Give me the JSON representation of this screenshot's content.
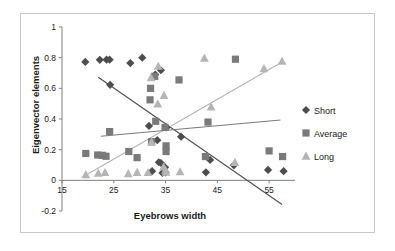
{
  "chart_data": {
    "type": "scatter",
    "title": "",
    "xlabel": "Eyebrows width",
    "ylabel": "Eigenvector elements",
    "xlim": [
      15,
      60
    ],
    "ylim": [
      -0.2,
      1
    ],
    "xticks": [
      15,
      25,
      35,
      45,
      55
    ],
    "yticks": [
      -0.2,
      0,
      0.2,
      0.4,
      0.6,
      0.8,
      1
    ],
    "xtick_labels": [
      "15",
      "25",
      "35",
      "45",
      "55"
    ],
    "ytick_labels": [
      "-0.2",
      "0",
      "0.2",
      "0.4",
      "0.6",
      "0.8",
      "1"
    ],
    "grid": false,
    "legend_position": "right",
    "colors": {
      "short": "#4d4d4d",
      "average": "#7a7a7a",
      "long": "#b5b5b5",
      "frame": "#c8c8c8",
      "axis": "#808080",
      "text": "#1a1a1a"
    },
    "series": [
      {
        "name": "Short",
        "marker": "diamond",
        "color": "#4d4d4d",
        "points": [
          [
            19.5,
            0.772
          ],
          [
            22.3,
            0.786
          ],
          [
            23.6,
            0.787
          ],
          [
            24.2,
            0.787
          ],
          [
            24.3,
            0.623
          ],
          [
            28.2,
            0.765
          ],
          [
            30.5,
            0.8
          ],
          [
            34.1,
            0.718
          ],
          [
            33.0,
            0.69
          ],
          [
            31.8,
            0.355
          ],
          [
            33.4,
            0.262
          ],
          [
            32.4,
            0.06
          ],
          [
            33.7,
            0.118
          ],
          [
            34.1,
            0.113
          ],
          [
            34.9,
            0.085
          ],
          [
            34.4,
            0.048
          ],
          [
            35.2,
            0.345
          ],
          [
            35.0,
            0.052
          ],
          [
            38.0,
            0.285
          ],
          [
            42.8,
            0.052
          ],
          [
            43.6,
            0.133
          ],
          [
            48.2,
            0.098
          ],
          [
            54.8,
            0.068
          ],
          [
            57.8,
            0.06
          ]
        ],
        "trendline": {
          "x0": 22.0,
          "y0": 0.672,
          "x1": 57.5,
          "y1": -0.158
        }
      },
      {
        "name": "Average",
        "marker": "square",
        "color": "#7a7a7a",
        "points": [
          [
            19.6,
            0.175
          ],
          [
            21.9,
            0.165
          ],
          [
            22.8,
            0.163
          ],
          [
            23.5,
            0.157
          ],
          [
            24.2,
            0.318
          ],
          [
            27.9,
            0.188
          ],
          [
            29.5,
            0.148
          ],
          [
            32.0,
            0.525
          ],
          [
            32.1,
            0.6
          ],
          [
            32.9,
            0.678
          ],
          [
            32.3,
            0.252
          ],
          [
            33.1,
            0.385
          ],
          [
            34.9,
            0.345
          ],
          [
            35.1,
            0.225
          ],
          [
            35.1,
            0.188
          ],
          [
            37.6,
            0.655
          ],
          [
            42.7,
            0.155
          ],
          [
            43.2,
            0.38
          ],
          [
            48.5,
            0.79
          ],
          [
            55.0,
            0.192
          ],
          [
            57.6,
            0.155
          ]
        ],
        "trendline": {
          "x0": 22.5,
          "y0": 0.288,
          "x1": 57.2,
          "y1": 0.393
        }
      },
      {
        "name": "Long",
        "marker": "triangle",
        "color": "#b5b5b5",
        "points": [
          [
            19.6,
            0.038
          ],
          [
            22.0,
            0.047
          ],
          [
            23.3,
            0.052
          ],
          [
            27.8,
            0.045
          ],
          [
            29.5,
            0.053
          ],
          [
            31.6,
            0.052
          ],
          [
            32.3,
            0.25
          ],
          [
            32.2,
            0.67
          ],
          [
            33.6,
            0.745
          ],
          [
            33.5,
            0.5
          ],
          [
            34.7,
            0.555
          ],
          [
            34.6,
            0.088
          ],
          [
            35.0,
            0.068
          ],
          [
            35.1,
            0.055
          ],
          [
            37.8,
            0.057
          ],
          [
            42.5,
            0.798
          ],
          [
            43.8,
            0.48
          ],
          [
            48.4,
            0.118
          ],
          [
            54.0,
            0.73
          ],
          [
            57.5,
            0.778
          ]
        ],
        "trendline": {
          "x0": 19.5,
          "y0": 0.032,
          "x1": 57.5,
          "y1": 0.772
        }
      }
    ]
  },
  "legend": {
    "items": [
      {
        "label": "Short",
        "marker": "diamond",
        "color": "#4d4d4d"
      },
      {
        "label": "Average",
        "marker": "square",
        "color": "#7a7a7a"
      },
      {
        "label": "Long",
        "marker": "triangle",
        "color": "#b5b5b5"
      }
    ]
  },
  "axes": {
    "x_title": "Eyebrows width",
    "y_title": "Eigenvector elements"
  }
}
